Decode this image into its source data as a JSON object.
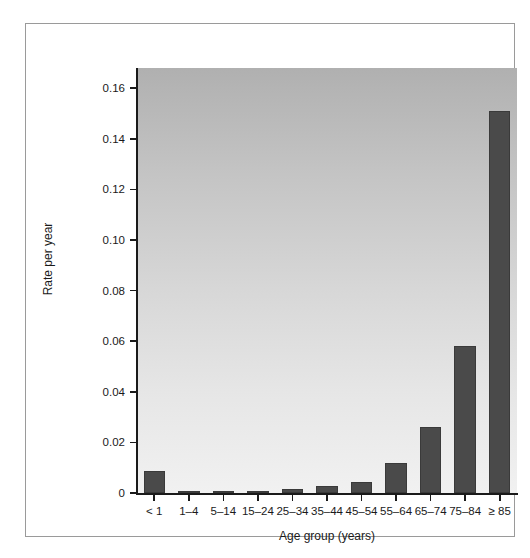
{
  "figure": {
    "background_color": "#ffffff",
    "frame_border_color": "#9a9a9a",
    "panel_gradient_top": "#b0b0b0",
    "panel_gradient_bottom": "#f1f1f1",
    "bar_color": "#4a4a4a"
  },
  "chart_data": {
    "type": "bar",
    "title": "",
    "xlabel": "Age group (years)",
    "ylabel": "Rate per year",
    "categories": [
      "< 1",
      "1–4",
      "5–14",
      "15–24",
      "25–34",
      "35–44",
      "45–54",
      "55–64",
      "65–74",
      "75–84",
      "≥ 85"
    ],
    "values": [
      0.0086,
      0.0006,
      0.0004,
      0.0007,
      0.0015,
      0.0026,
      0.0043,
      0.012,
      0.026,
      0.058,
      0.151
    ],
    "ylim": [
      0,
      0.168
    ],
    "yticks": [
      0,
      0.02,
      0.04,
      0.06,
      0.08,
      0.1,
      0.12,
      0.14,
      0.16
    ],
    "ytick_labels": [
      "0",
      "0.02",
      "0.04",
      "0.06",
      "0.08",
      "0.10",
      "0.12",
      "0.14",
      "0.16"
    ],
    "grid": false,
    "legend": null,
    "legend_position": "none"
  }
}
